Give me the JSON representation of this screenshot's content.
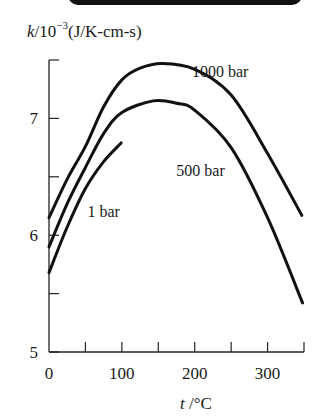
{
  "chart_data": {
    "type": "line",
    "title": "",
    "ylabel": {
      "symbol": "k",
      "unit_prefix": "/10",
      "exponent": "−3",
      "unit": "(J/K-cm-s)"
    },
    "xlabel": {
      "symbol": "t",
      "unit": " /°C"
    },
    "xlim": [
      0,
      350
    ],
    "ylim": [
      5,
      7.5
    ],
    "x_ticks": [
      0,
      50,
      100,
      150,
      200,
      250,
      300,
      350
    ],
    "x_tick_labels": [
      "0",
      "100",
      "200",
      "300"
    ],
    "x_tick_label_values": [
      0,
      100,
      200,
      300
    ],
    "y_ticks": [
      5,
      5.5,
      6,
      6.5,
      7,
      7.5
    ],
    "y_tick_labels": [
      "5",
      "6",
      "7"
    ],
    "y_tick_label_values": [
      5,
      6,
      7
    ],
    "grid": false,
    "legend": "inline labels",
    "series": [
      {
        "name": "1000 bar",
        "x": [
          0,
          25,
          50,
          75,
          100,
          125,
          156,
          200,
          250,
          300,
          347
        ],
        "values": [
          6.15,
          6.48,
          6.76,
          7.1,
          7.33,
          7.43,
          7.47,
          7.42,
          7.2,
          6.7,
          6.17
        ]
      },
      {
        "name": "500 bar",
        "x": [
          0,
          25,
          50,
          75,
          100,
          143,
          175,
          200,
          250,
          300,
          348
        ],
        "values": [
          5.9,
          6.27,
          6.58,
          6.87,
          7.05,
          7.15,
          7.13,
          7.07,
          6.75,
          6.15,
          5.42
        ]
      },
      {
        "name": "1 bar",
        "x": [
          0,
          25,
          50,
          75,
          99
        ],
        "values": [
          5.68,
          6.07,
          6.4,
          6.63,
          6.79
        ]
      }
    ],
    "annotations": [
      {
        "text": "1000 bar",
        "x": 235,
        "y": 7.4
      },
      {
        "text": "500 bar",
        "x": 208,
        "y": 6.55
      },
      {
        "text": "1 bar",
        "x": 75,
        "y": 6.2
      }
    ]
  }
}
